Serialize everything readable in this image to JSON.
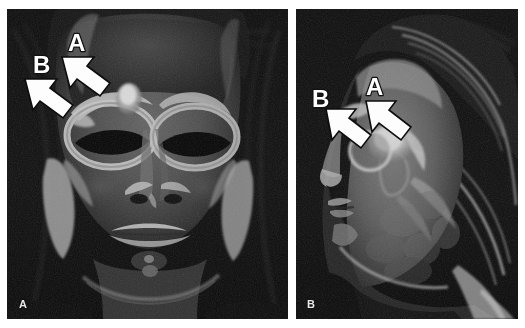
{
  "figure": {
    "kind": "radiology-figure",
    "background_color": "#ffffff",
    "panel_background_color": "#090909",
    "annotation_fill_color": "#fdfdfd",
    "annotation_outline_color": "#0d0d0d",
    "panel_letter_color": "#e9e9e9"
  },
  "panels": [
    {
      "id": "panel-a",
      "panel_letter": "A",
      "view": "frontal",
      "annotations": [
        {
          "label": "A",
          "arrow_direction": "down-right",
          "target": "bright-nodular-lesion-superior-to-left-orbit"
        },
        {
          "label": "B",
          "arrow_direction": "down-right",
          "target": "superomedial-orbital-rim"
        }
      ]
    },
    {
      "id": "panel-b",
      "panel_letter": "B",
      "view": "lateral",
      "annotations": [
        {
          "label": "A",
          "arrow_direction": "down-right",
          "target": "posterior-lesion-margin"
        },
        {
          "label": "B",
          "arrow_direction": "down-right",
          "target": "anterior-lesion-margin"
        }
      ]
    }
  ]
}
